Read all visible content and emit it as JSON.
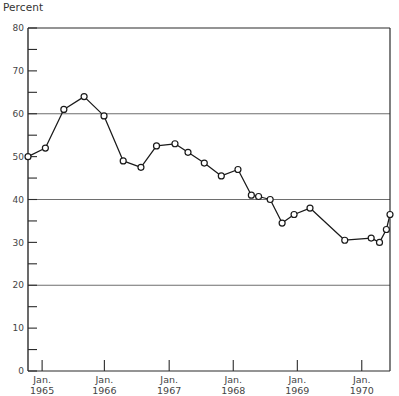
{
  "chart_data": {
    "type": "line",
    "title": "",
    "ylabel": "Percent",
    "xlabel": "",
    "ylim": [
      0,
      80
    ],
    "xlim": [
      0,
      100
    ],
    "grid": "horizontal gridlines at 20, 40 and 60",
    "legend": "none",
    "y_ticks_major": [
      0,
      10,
      20,
      30,
      40,
      50,
      60,
      70,
      80
    ],
    "y_ticks_minor": [
      5,
      15,
      25,
      35,
      45,
      55,
      65,
      75
    ],
    "y_tick_labels": [
      "0",
      "10",
      "20",
      "30",
      "40",
      "50",
      "60",
      "70",
      "80"
    ],
    "gridline_values": [
      20,
      40,
      60
    ],
    "x_tick_labels": [
      {
        "line1": "Jan.",
        "line2": "1965"
      },
      {
        "line1": "Jan.",
        "line2": "1966"
      },
      {
        "line1": "Jan.",
        "line2": "1967"
      },
      {
        "line1": "Jan.",
        "line2": "1968"
      },
      {
        "line1": "Jan.",
        "line2": "1969"
      },
      {
        "line1": "Jan.",
        "line2": "1970"
      }
    ],
    "x_tick_positions": [
      3.9,
      21.1,
      39.0,
      56.7,
      74.4,
      92.2
    ],
    "series": [
      {
        "name": "Percent",
        "marker": "open-circle",
        "color": "#1a1a1a",
        "x": [
          0.0,
          4.8,
          9.9,
          15.5,
          21.0,
          26.3,
          31.2,
          35.5,
          40.6,
          44.2,
          48.7,
          53.4,
          58.0,
          61.7,
          63.7,
          66.9,
          70.2,
          73.5,
          77.9,
          87.5,
          94.8,
          97.1,
          99.0,
          100.0
        ],
        "y": [
          50.0,
          52.0,
          61.0,
          64.0,
          59.5,
          49.0,
          47.5,
          52.5,
          53.0,
          51.0,
          48.5,
          45.5,
          47.0,
          41.0,
          40.7,
          40.0,
          34.5,
          36.5,
          38.0,
          30.5,
          31.0,
          30.0,
          33.0,
          36.5
        ]
      }
    ]
  },
  "plot": {
    "left_px": 28,
    "right_px": 390,
    "top_px": 28,
    "bottom_px": 371
  }
}
